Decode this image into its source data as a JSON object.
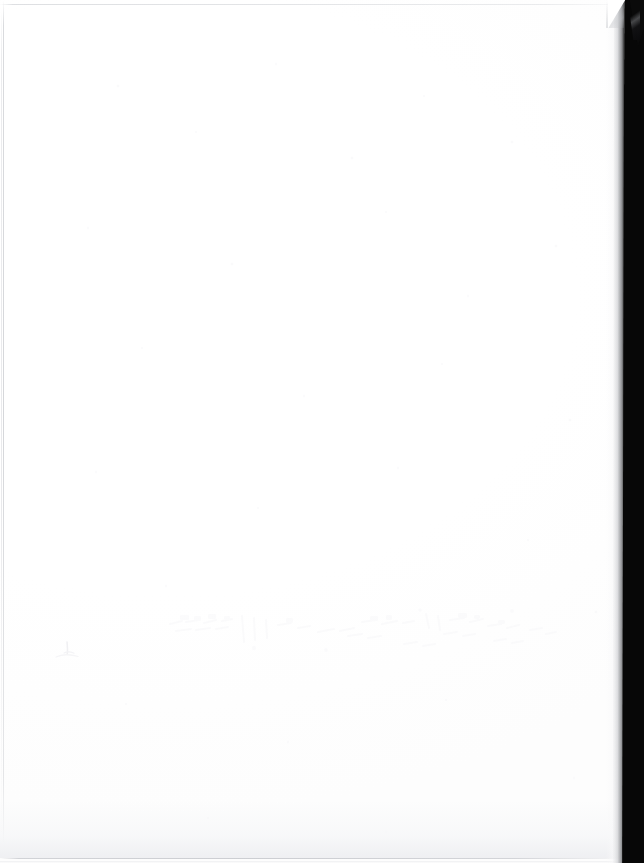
{
  "document": {
    "kind": "scanned-page",
    "title": "Blank scanned page",
    "orientation": "portrait",
    "content_text": "",
    "width_px": 644,
    "height_px": 863
  },
  "page": {
    "paper_color": "#ffffff",
    "background_color": "#ffffff"
  },
  "artifacts": {
    "scanner_bed": {
      "name": "dark scanner bed strip",
      "position": "right edge",
      "color": "#070707",
      "width_px": 26
    },
    "corner_notch": {
      "name": "torn corner",
      "position": "top-right",
      "color": "#0a0a0a"
    },
    "edge_lines": {
      "name": "paper edge shadow lines",
      "color": "#d0d2d6",
      "sides": "left, top, bottom"
    },
    "show_through": {
      "name": "ink bleed-through from reverse side",
      "legible": "no",
      "region": "center-lower, approx x 160-560, y 600-660",
      "color": "#fafafb"
    },
    "pencil_mark": {
      "name": "faint pencil tick",
      "position": "left margin, approx x 65, y 652",
      "color": "#f2f2f4"
    }
  }
}
